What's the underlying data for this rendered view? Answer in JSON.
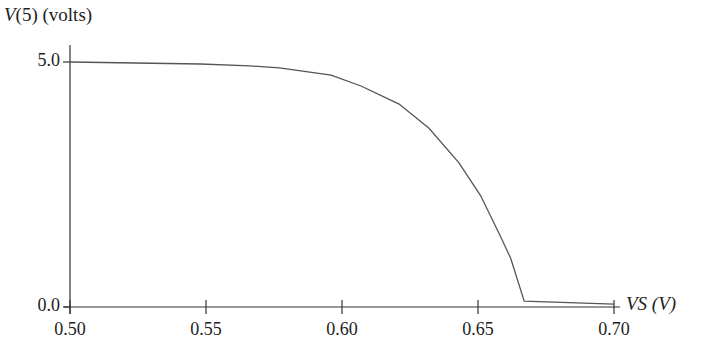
{
  "chart_data": {
    "type": "line",
    "title": "",
    "xlabel": "VS (V)",
    "ylabel": "V(5) (volts)",
    "xlim": [
      0.5,
      0.7
    ],
    "ylim": [
      0.0,
      5.0
    ],
    "grid": false,
    "legend": null,
    "x_ticks": [
      "0.50",
      "0.55",
      "0.60",
      "0.65",
      "0.70"
    ],
    "y_ticks": [
      "0.0",
      "5.0"
    ],
    "series": [
      {
        "name": "V(5)",
        "color": "#555555",
        "x": [
          0.5,
          0.548,
          0.566,
          0.577,
          0.596,
          0.607,
          0.621,
          0.632,
          0.643,
          0.651,
          0.658,
          0.662,
          0.667,
          0.7
        ],
        "y": [
          5.0,
          4.96,
          4.92,
          4.88,
          4.73,
          4.51,
          4.14,
          3.65,
          2.94,
          2.27,
          1.47,
          1.0,
          0.12,
          0.06
        ]
      }
    ]
  },
  "labels": {
    "y_axis_prefix": "V",
    "y_axis_rest": "(5) (volts)",
    "x_axis": "VS (V)"
  }
}
